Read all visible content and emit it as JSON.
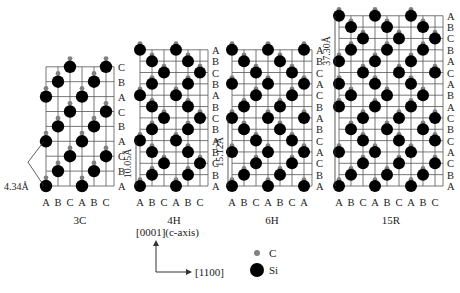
{
  "colors": {
    "grid": "#555555",
    "si": "#000000",
    "c": "#808080",
    "text": "#222222"
  },
  "polytypes": [
    {
      "name": "3C",
      "x0": 46,
      "dx": 12,
      "cols": [
        "A",
        "B",
        "C",
        "A",
        "B",
        "C"
      ],
      "y_bottom": 186,
      "dy": 14.9,
      "stacking_top_to_bottom": [
        "C",
        "B",
        "A",
        "C",
        "B",
        "A",
        "C",
        "B",
        "A"
      ],
      "dimension": {
        "label": "4.34Å",
        "orientation": "horizontal"
      }
    },
    {
      "name": "4H",
      "x0": 140,
      "dx": 12,
      "cols": [
        "A",
        "B",
        "C",
        "A",
        "B",
        "C"
      ],
      "y_bottom": 186,
      "dy": 11.35,
      "stacking_top_to_bottom": [
        "A",
        "B",
        "C",
        "B",
        "A",
        "B",
        "C",
        "B",
        "A",
        "B",
        "C",
        "B",
        "A"
      ],
      "dimension": {
        "label": "10.05Å",
        "orientation": "vertical"
      }
    },
    {
      "name": "6H",
      "x0": 232,
      "dx": 12,
      "cols": [
        "A",
        "B",
        "C",
        "A",
        "B",
        "C",
        "A"
      ],
      "y_bottom": 186,
      "dy": 11.35,
      "stacking_top_to_bottom": [
        "A",
        "B",
        "C",
        "A",
        "C",
        "B",
        "A",
        "B",
        "C",
        "A",
        "C",
        "B",
        "A"
      ],
      "dimension": {
        "label": "15.12Å",
        "orientation": "vertical"
      }
    },
    {
      "name": "15R",
      "x0": 339,
      "dx": 12,
      "cols": [
        "A",
        "B",
        "C",
        "A",
        "B",
        "C",
        "A",
        "B",
        "C"
      ],
      "y_bottom": 186,
      "dy": 11.35,
      "stacking_top_to_bottom": [
        "A",
        "B",
        "C",
        "B",
        "A",
        "C",
        "A",
        "B",
        "A",
        "C",
        "B",
        "C",
        "A",
        "C",
        "B",
        "A"
      ],
      "dimension": {
        "label": "37.30Å",
        "orientation": "vertical"
      }
    }
  ],
  "axes": {
    "vertical_label": "[0001](c-axis)",
    "horizontal_label": "[1100]"
  },
  "legend": [
    {
      "symbol": "small-gray-dot",
      "label": "C"
    },
    {
      "symbol": "large-black-dot",
      "label": "Si"
    }
  ]
}
